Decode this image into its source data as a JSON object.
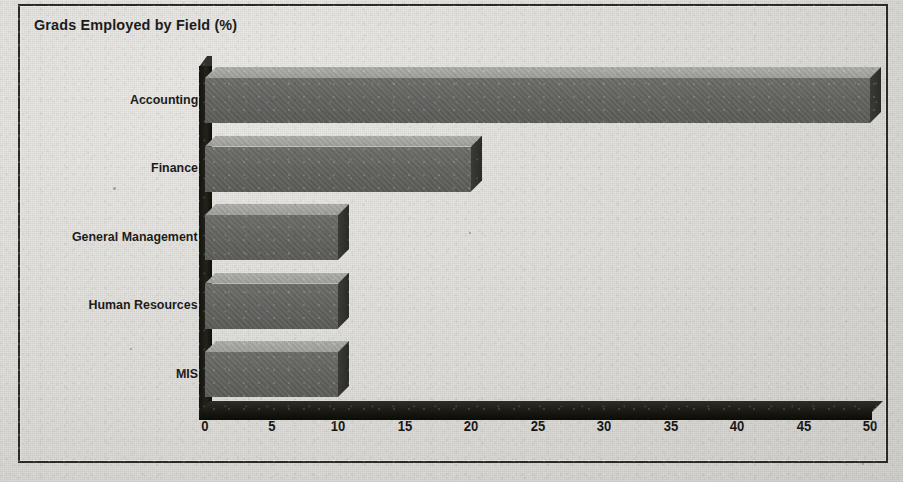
{
  "chart_data": {
    "type": "bar",
    "orientation": "horizontal",
    "title": "Grads Employed by Field (%)",
    "xlabel": "",
    "ylabel": "",
    "categories": [
      "Accounting",
      "Finance",
      "General Management",
      "Human Resources",
      "MIS"
    ],
    "values": [
      50,
      20,
      10,
      10,
      10
    ],
    "xlim": [
      0,
      50
    ],
    "xticks": [
      0,
      5,
      10,
      15,
      20,
      25,
      30,
      35,
      40,
      45,
      50
    ],
    "xtick_labels": [
      "0",
      "5",
      "10",
      "15",
      "20",
      "25",
      "30",
      "35",
      "40",
      "45",
      "50"
    ],
    "grid": false,
    "legend": false,
    "style_3d": true,
    "unit": "%"
  },
  "colors": {
    "background": "#dedcd8",
    "frame": "#2a2a28",
    "bar_front": "#636360",
    "bar_top": "#a2a29e",
    "bar_side": "#32322e",
    "axis": "#141410",
    "text": "#1b1b1a"
  }
}
